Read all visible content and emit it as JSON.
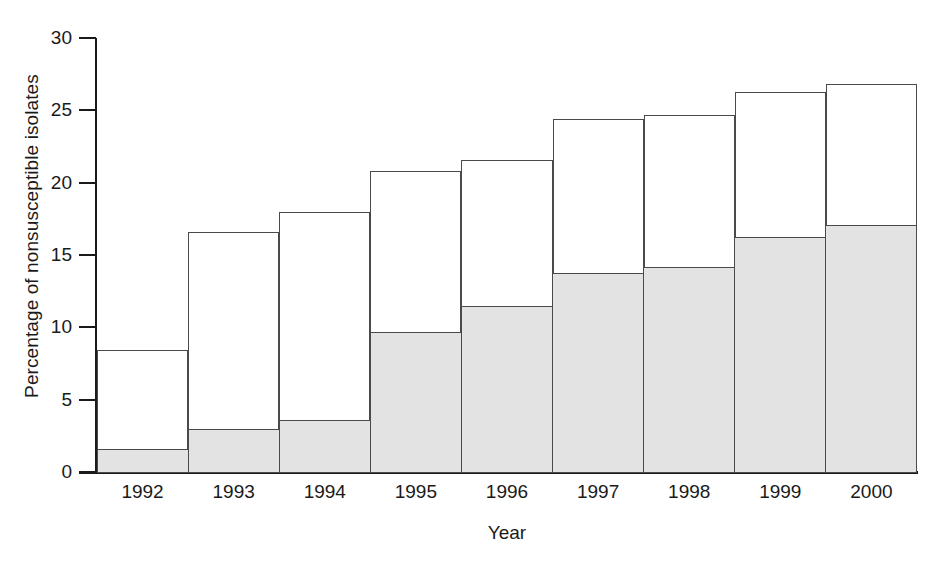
{
  "chart_data": {
    "type": "bar",
    "subtype": "stacked",
    "title": "",
    "xlabel": "Year",
    "ylabel": "Percentage of nonsusceptible isolates",
    "categories": [
      "1992",
      "1993",
      "1994",
      "1995",
      "1996",
      "1997",
      "1998",
      "1999",
      "2000"
    ],
    "series": [
      {
        "name": "lower-segment",
        "fill": "#e3e3e3",
        "values": [
          1.6,
          3.0,
          3.6,
          9.7,
          11.5,
          13.8,
          14.2,
          16.3,
          17.1
        ]
      },
      {
        "name": "upper-segment",
        "fill": "#ffffff",
        "values": [
          6.8,
          13.6,
          14.4,
          11.1,
          10.1,
          10.6,
          10.5,
          10.0,
          9.7
        ]
      }
    ],
    "totals": [
      8.4,
      16.6,
      18.0,
      20.8,
      21.6,
      24.4,
      24.7,
      26.3,
      26.8
    ],
    "ylim": [
      0,
      30
    ],
    "yticks": [
      0,
      5,
      10,
      15,
      20,
      25,
      30
    ],
    "ytick_labels": [
      "0",
      "5",
      "10",
      "15",
      "20",
      "25",
      "30"
    ],
    "grid": false,
    "legend": "none",
    "bar_gap": 0,
    "outline_color": "#4a4a4a",
    "axis_color": "#1a1a1a"
  }
}
